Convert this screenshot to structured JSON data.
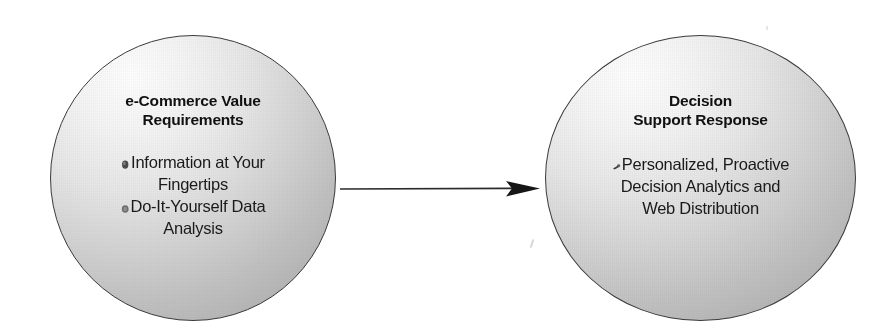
{
  "diagram": {
    "type": "two-node-flow",
    "background_color": "#ffffff",
    "node_fill_light": "#fdfdfd",
    "node_fill_dark": "#a2a2a2",
    "node_border_color": "#3a3a3a",
    "text_color": "#111111",
    "arrow_color": "#2b2b2b",
    "nodes": [
      {
        "id": "e-commerce-value-requirements",
        "title": "e-Commerce Value\nRequirements",
        "bullets": [
          {
            "icon": "blob-bullet-icon",
            "text": "Information at Your\nFingertips"
          },
          {
            "icon": "blob-bullet-icon",
            "text": "Do-It-Yourself Data\nAnalysis"
          }
        ]
      },
      {
        "id": "decision-support-response",
        "title": "Decision\nSupport Response",
        "bullets": [
          {
            "icon": "blob-bullet-icon",
            "text": "Personalized, Proactive\nDecision Analytics and\nWeb Distribution"
          }
        ]
      }
    ],
    "connector": {
      "id": "left-to-right-arrow",
      "icon": "arrow-right-icon",
      "label": "",
      "direction": "left-to-right"
    }
  }
}
